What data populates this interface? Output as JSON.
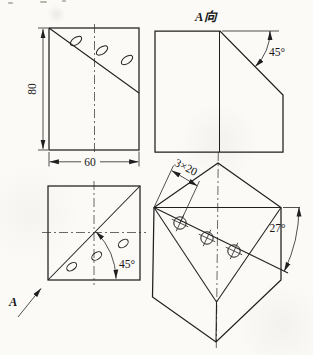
{
  "drawing": {
    "front_view": {
      "height_dim": "80",
      "width_dim": "60",
      "hole_count": 3
    },
    "a_view": {
      "title": "A向",
      "chamfer_angle": "45°"
    },
    "plan_view": {
      "diagonal_angle": "45°",
      "view_direction_label": "A",
      "hole_count": 2
    },
    "axon_view": {
      "holes_dim": "3×20",
      "slope_angle": "27°",
      "hole_count": 3
    },
    "colors": {
      "ink": "#1f1f1f",
      "paper": "#fbfaf7"
    }
  }
}
